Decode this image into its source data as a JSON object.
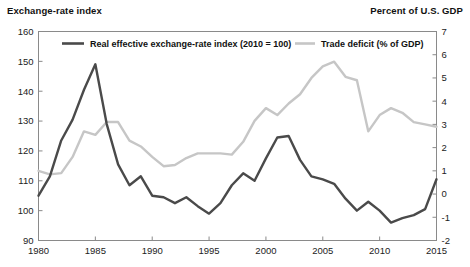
{
  "header": {
    "left_label": "Exchange-rate index",
    "right_label": "Percent of U.S. GDP"
  },
  "colors": {
    "series_dark": "#4a4a4a",
    "series_light": "#c6c6c6",
    "axis": "#8a8a8a",
    "text": "#111111",
    "background": "#ffffff"
  },
  "chart_data": {
    "type": "line",
    "title": "",
    "subtitle": "",
    "xlabel": "",
    "ylabel": "Exchange-rate index",
    "y2label": "Percent of U.S. GDP",
    "grid": false,
    "legend_position": "top-inside",
    "xlim": [
      1980,
      2015
    ],
    "ylim": [
      90,
      160
    ],
    "y2lim": [
      -2,
      7
    ],
    "xticks": [
      1980,
      1985,
      1990,
      1995,
      2000,
      2005,
      2010,
      2015
    ],
    "xtick_labels": [
      "1980",
      "1985",
      "1990",
      "1995",
      "2000",
      "2005",
      "2010",
      "2015"
    ],
    "yticks": [
      90,
      100,
      110,
      120,
      130,
      140,
      150,
      160
    ],
    "ytick_labels": [
      "90",
      "100",
      "110",
      "120",
      "130",
      "140",
      "150",
      "160"
    ],
    "y2ticks": [
      -2,
      -1,
      0,
      1,
      2,
      3,
      4,
      5,
      6,
      7
    ],
    "y2tick_labels": [
      "-2",
      "-1",
      "0",
      "1",
      "2",
      "3",
      "4",
      "5",
      "6",
      "7"
    ],
    "x": [
      1980,
      1981,
      1982,
      1983,
      1984,
      1985,
      1986,
      1987,
      1988,
      1989,
      1990,
      1991,
      1992,
      1993,
      1994,
      1995,
      1996,
      1997,
      1998,
      1999,
      2000,
      2001,
      2002,
      2003,
      2004,
      2005,
      2006,
      2007,
      2008,
      2009,
      2010,
      2011,
      2012,
      2013,
      2014,
      2015
    ],
    "series": [
      {
        "name": "Real effective exchange-rate index (2010 = 100)",
        "axis": "left",
        "color": "#4a4a4a",
        "values": [
          105.0,
          111.5,
          123.5,
          130.5,
          140.5,
          149.0,
          129.0,
          115.5,
          108.5,
          111.5,
          105.0,
          104.5,
          102.5,
          104.5,
          101.5,
          99.0,
          102.5,
          108.5,
          112.5,
          110.0,
          117.5,
          124.5,
          125.0,
          117.0,
          111.5,
          110.5,
          109.0,
          104.0,
          100.0,
          103.0,
          100.0,
          96.0,
          97.5,
          98.5,
          100.5,
          110.5
        ]
      },
      {
        "name": "Trade deficit (% of GDP)",
        "axis": "right",
        "color": "#c6c6c6",
        "values": [
          1.0,
          0.85,
          0.9,
          1.6,
          2.7,
          2.55,
          3.1,
          3.1,
          2.3,
          2.05,
          1.6,
          1.2,
          1.25,
          1.55,
          1.75,
          1.75,
          1.75,
          1.7,
          2.25,
          3.15,
          3.7,
          3.4,
          3.9,
          4.3,
          5.0,
          5.5,
          5.7,
          5.05,
          4.9,
          2.7,
          3.4,
          3.7,
          3.5,
          3.1,
          3.0,
          2.9
        ]
      }
    ],
    "legend": [
      {
        "label": "Real effective exchange-rate index (2010 = 100)",
        "color": "#4a4a4a"
      },
      {
        "label": "Trade deficit (% of GDP)",
        "color": "#c6c6c6"
      }
    ]
  }
}
